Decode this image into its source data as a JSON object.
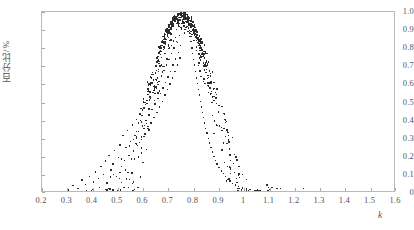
{
  "chart_data": {
    "type": "scatter",
    "title": "",
    "xlabel": "k",
    "ylabel": "百分比/%",
    "xlim": [
      0.2,
      1.6
    ],
    "ylim": [
      0,
      1.0
    ],
    "grid": false,
    "legend": null,
    "x_ticks": [
      "0.2",
      "0.3",
      "0.4",
      "0.5",
      "0.6",
      "0.7",
      "0.8",
      "0.9",
      "1",
      "1.1",
      "1.2",
      "1.3",
      "1.4",
      "1.5",
      "1.6"
    ],
    "x_tick_values": [
      0.2,
      0.3,
      0.4,
      0.5,
      0.6,
      0.7,
      0.8,
      0.9,
      1.0,
      1.1,
      1.2,
      1.3,
      1.4,
      1.5,
      1.6
    ],
    "y_ticks": [
      "0",
      "0.1",
      "0.2",
      "0.3",
      "0.4",
      "0.5",
      "0.6",
      "0.7",
      "0.8",
      "0.9",
      "1.0"
    ],
    "y_tick_values": [
      0,
      0.1,
      0.2,
      0.3,
      0.4,
      0.5,
      0.6,
      0.7,
      0.8,
      0.9,
      1.0
    ],
    "marker": "square-dot",
    "marker_color": "#2c2c2c",
    "marker_size_px": 1.4,
    "frame_color": "#b9b9b9",
    "background": "#ffffff",
    "peak_x": 0.75,
    "peak_y": 1.0,
    "sigma": 0.135,
    "point_count": 620,
    "points": [
      [
        0.3,
        0.02
      ],
      [
        0.32,
        0.045
      ],
      [
        0.34,
        0.03
      ],
      [
        0.355,
        0.075
      ],
      [
        0.37,
        0.05
      ],
      [
        0.385,
        0.095
      ],
      [
        0.4,
        0.065
      ],
      [
        0.41,
        0.12
      ],
      [
        0.42,
        0.085
      ],
      [
        0.43,
        0.15
      ],
      [
        0.44,
        0.105
      ],
      [
        0.448,
        0.18
      ],
      [
        0.455,
        0.06
      ],
      [
        0.462,
        0.21
      ],
      [
        0.47,
        0.13
      ],
      [
        0.478,
        0.165
      ],
      [
        0.485,
        0.24
      ],
      [
        0.492,
        0.095
      ],
      [
        0.5,
        0.2
      ],
      [
        0.505,
        0.27
      ],
      [
        0.512,
        0.15
      ],
      [
        0.518,
        0.32
      ],
      [
        0.524,
        0.185
      ],
      [
        0.53,
        0.255
      ],
      [
        0.536,
        0.35
      ],
      [
        0.542,
        0.21
      ],
      [
        0.548,
        0.29
      ],
      [
        0.554,
        0.38
      ],
      [
        0.56,
        0.235
      ],
      [
        0.565,
        0.32
      ],
      [
        0.57,
        0.41
      ],
      [
        0.575,
        0.265
      ],
      [
        0.58,
        0.345
      ],
      [
        0.585,
        0.44
      ],
      [
        0.59,
        0.3
      ],
      [
        0.595,
        0.375
      ],
      [
        0.6,
        0.47
      ],
      [
        0.604,
        0.33
      ],
      [
        0.608,
        0.405
      ],
      [
        0.612,
        0.5
      ],
      [
        0.616,
        0.36
      ],
      [
        0.62,
        0.435
      ],
      [
        0.624,
        0.53
      ],
      [
        0.628,
        0.39
      ],
      [
        0.632,
        0.465
      ],
      [
        0.636,
        0.56
      ],
      [
        0.64,
        0.42
      ],
      [
        0.644,
        0.495
      ],
      [
        0.648,
        0.59
      ],
      [
        0.652,
        0.45
      ],
      [
        0.656,
        0.525
      ],
      [
        0.66,
        0.62
      ],
      [
        0.663,
        0.48
      ],
      [
        0.666,
        0.555
      ],
      [
        0.67,
        0.65
      ],
      [
        0.673,
        0.51
      ],
      [
        0.676,
        0.585
      ],
      [
        0.68,
        0.68
      ],
      [
        0.683,
        0.545
      ],
      [
        0.686,
        0.615
      ],
      [
        0.69,
        0.71
      ],
      [
        0.693,
        0.575
      ],
      [
        0.696,
        0.645
      ],
      [
        0.7,
        0.74
      ],
      [
        0.703,
        0.605
      ],
      [
        0.706,
        0.675
      ],
      [
        0.71,
        0.775
      ],
      [
        0.713,
        0.64
      ],
      [
        0.716,
        0.71
      ],
      [
        0.72,
        0.805
      ],
      [
        0.723,
        0.675
      ],
      [
        0.726,
        0.745
      ],
      [
        0.73,
        0.84
      ],
      [
        0.733,
        0.71
      ],
      [
        0.736,
        0.78
      ],
      [
        0.74,
        0.875
      ],
      [
        0.743,
        0.75
      ],
      [
        0.746,
        0.82
      ],
      [
        0.75,
        0.91
      ],
      [
        0.752,
        0.96
      ],
      [
        0.755,
        0.985
      ],
      [
        0.758,
        0.995
      ],
      [
        0.76,
        1.0
      ],
      [
        0.763,
        0.998
      ],
      [
        0.766,
        0.99
      ],
      [
        0.77,
        0.975
      ],
      [
        0.773,
        0.955
      ],
      [
        0.776,
        0.93
      ],
      [
        0.78,
        0.9
      ],
      [
        0.783,
        0.87
      ],
      [
        0.786,
        0.84
      ],
      [
        0.79,
        0.805
      ],
      [
        0.793,
        0.775
      ],
      [
        0.796,
        0.74
      ],
      [
        0.8,
        0.71
      ],
      [
        0.804,
        0.675
      ],
      [
        0.808,
        0.64
      ],
      [
        0.812,
        0.61
      ],
      [
        0.816,
        0.575
      ],
      [
        0.82,
        0.545
      ],
      [
        0.824,
        0.51
      ],
      [
        0.828,
        0.48
      ],
      [
        0.832,
        0.45
      ],
      [
        0.836,
        0.42
      ],
      [
        0.84,
        0.39
      ],
      [
        0.845,
        0.36
      ],
      [
        0.85,
        0.335
      ],
      [
        0.855,
        0.305
      ],
      [
        0.86,
        0.28
      ],
      [
        0.866,
        0.255
      ],
      [
        0.872,
        0.23
      ],
      [
        0.878,
        0.205
      ],
      [
        0.884,
        0.185
      ],
      [
        0.89,
        0.165
      ],
      [
        0.898,
        0.145
      ],
      [
        0.906,
        0.125
      ],
      [
        0.914,
        0.11
      ],
      [
        0.922,
        0.095
      ],
      [
        0.93,
        0.08
      ],
      [
        0.94,
        0.07
      ],
      [
        0.95,
        0.058
      ],
      [
        0.962,
        0.048
      ],
      [
        0.975,
        0.04
      ],
      [
        0.99,
        0.032
      ],
      [
        1.005,
        0.026
      ],
      [
        1.02,
        0.022
      ],
      [
        1.04,
        0.018
      ],
      [
        1.06,
        0.015
      ],
      [
        1.08,
        0.012
      ],
      [
        1.1,
        0.01
      ],
      [
        1.125,
        0.008
      ],
      [
        1.15,
        0.007
      ],
      [
        1.175,
        0.006
      ],
      [
        1.2,
        0.005
      ],
      [
        1.23,
        0.004
      ]
    ]
  },
  "axes": {
    "x_axis_name": "k-axis",
    "y_axis_name": "percentage-axis"
  }
}
